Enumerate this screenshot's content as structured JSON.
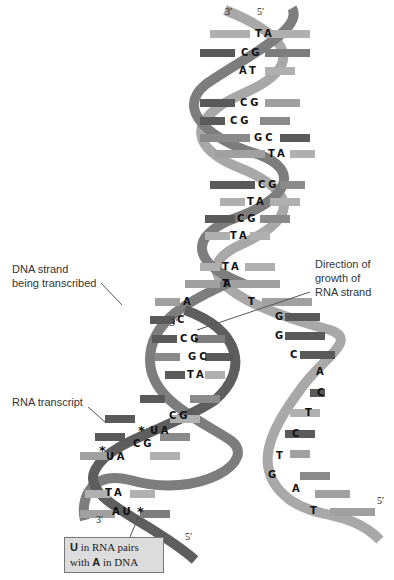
{
  "colors": {
    "dna_template_strand": "#7d7d7d",
    "dna_coding_strand": "#a8a8a8",
    "rna_strand": "#5e5e5e",
    "base_dark": "#5a5a5a",
    "base_light": "#b0b0b0",
    "callout_bg": "#dcdcdc"
  },
  "ends": {
    "top_left": "3′",
    "top_right": "5′",
    "rna_growth_end": "3′",
    "bottom_left": "3′",
    "bottom_mid": "5′",
    "bottom_right": "5′"
  },
  "labels": {
    "dna_strand": [
      "DNA strand",
      "being transcribed"
    ],
    "direction": [
      "Direction of",
      "growth of",
      "RNA strand"
    ],
    "rna_transcript": "RNA transcript",
    "callout": {
      "line1_bold": "U",
      "line1_rest": " in RNA pairs",
      "line2_pre": "with ",
      "line2_bold": "A",
      "line2_rest": " in DNA"
    }
  },
  "double_helix_pairs": [
    "TA",
    "CG",
    "AT",
    "CG",
    "CG",
    "GC",
    "TA",
    "CG",
    "TA",
    "CG",
    "TA",
    "TA"
  ],
  "open_region": {
    "template_bases": [
      "A",
      "A",
      "C"
    ],
    "coding_bases": [
      "T",
      "T",
      "G",
      "G",
      "C",
      "A",
      "C",
      "T",
      "C",
      "T",
      "G",
      "A",
      "T"
    ]
  },
  "rna_dna_hybrid_pairs": [
    "CG",
    "GC",
    "TA",
    "CG",
    "UA",
    "CG",
    "UA",
    "TA",
    "AU"
  ],
  "markers": {
    "asterisk": "*"
  }
}
